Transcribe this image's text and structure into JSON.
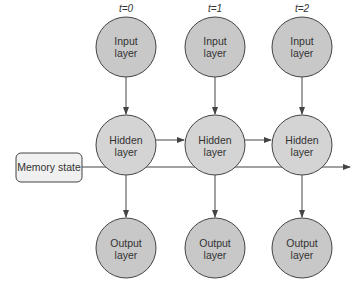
{
  "diagram": {
    "type": "unrolled-recurrent-network",
    "colors": {
      "node_fill": "#c8c8c8",
      "node_stroke": "#444444",
      "memory_fill": "#f0f0f0",
      "line": "#444444",
      "text": "#333333"
    },
    "memory_state": {
      "label": "Memory state"
    },
    "timesteps": [
      {
        "time_label": "t=0",
        "input": {
          "line1": "Input",
          "line2": "layer"
        },
        "hidden": {
          "line1": "Hidden",
          "line2": "layer"
        },
        "output": {
          "line1": "Output",
          "line2": "layer"
        }
      },
      {
        "time_label": "t=1",
        "input": {
          "line1": "Input",
          "line2": "layer"
        },
        "hidden": {
          "line1": "Hidden",
          "line2": "layer"
        },
        "output": {
          "line1": "Output",
          "line2": "layer"
        }
      },
      {
        "time_label": "t=2",
        "input": {
          "line1": "Input",
          "line2": "layer"
        },
        "hidden": {
          "line1": "Hidden",
          "line2": "layer"
        },
        "output": {
          "line1": "Output",
          "line2": "layer"
        }
      }
    ],
    "edges": [
      "input(t=0) -> hidden(t=0)",
      "input(t=1) -> hidden(t=1)",
      "input(t=2) -> hidden(t=2)",
      "hidden(t=0) -> output(t=0)",
      "hidden(t=1) -> output(t=1)",
      "hidden(t=2) -> output(t=2)",
      "hidden(t=0) -> hidden(t=1)",
      "hidden(t=1) -> hidden(t=2)",
      "memory_state -> through all hidden -> right"
    ]
  }
}
